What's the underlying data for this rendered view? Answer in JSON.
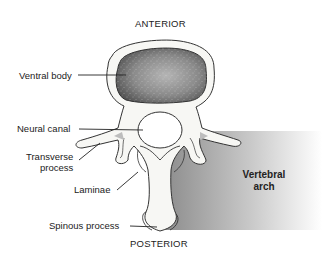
{
  "diagram": {
    "orientation_top": "ANTERIOR",
    "orientation_bottom": "POSTERIOR",
    "region_label_line1": "Vertebral",
    "region_label_line2": "arch",
    "labels": [
      {
        "id": "ventral-body",
        "text": "Ventral body"
      },
      {
        "id": "neural-canal",
        "text": "Neural canal"
      },
      {
        "id": "transverse-process-line1",
        "text": "Transverse"
      },
      {
        "id": "transverse-process-line2",
        "text": "process"
      },
      {
        "id": "laminae",
        "text": "Laminae"
      },
      {
        "id": "spinous-process",
        "text": "Spinous process"
      }
    ],
    "colors": {
      "bone_fill": "#f7f7f4",
      "outline": "#333333",
      "body_center": "#9a9a9a",
      "body_edge": "#505050",
      "arch_gradient_start": "#8a8a8a",
      "arch_gradient_end": "#ffffff"
    }
  }
}
